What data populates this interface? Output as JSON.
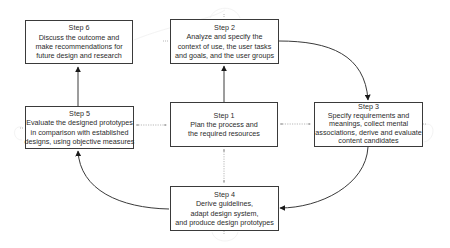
{
  "diagram": {
    "type": "process-cycle",
    "colors": {
      "box_border": "#3a3a3a",
      "text": "#2b2b2b",
      "arrow": "#3a3a3a",
      "dotted_connector": "#9a9a9a",
      "background": "#ffffff"
    },
    "steps": {
      "step1": {
        "title": "Step 1",
        "lines": [
          "Plan the process and",
          "the required resources"
        ]
      },
      "step2": {
        "title": "Step 2",
        "lines": [
          "Analyze and specify the",
          "context of use, the user tasks",
          "and goals, and the user groups"
        ]
      },
      "step3": {
        "title": "Step 3",
        "lines": [
          "Specify requirements and",
          "meanings, collect mental",
          "associations, derive and evaluate",
          "content candidates"
        ]
      },
      "step4": {
        "title": "Step 4",
        "lines": [
          "Derive guidelines,",
          "adapt design system,",
          "and produce design prototypes"
        ]
      },
      "step5": {
        "title": "Step 5",
        "lines": [
          "Evaluate the designed prototypes",
          "in comparison with established",
          "designs, using objective measures"
        ]
      },
      "step6": {
        "title": "Step 6",
        "lines": [
          "Discuss the outcome and",
          "make recommendations for",
          "future design and research"
        ]
      }
    },
    "flow": [
      {
        "from": "Step 1",
        "to": "Step 2",
        "style": "solid"
      },
      {
        "from": "Step 2",
        "to": "Step 3",
        "style": "solid-curved"
      },
      {
        "from": "Step 3",
        "to": "Step 4",
        "style": "solid-curved"
      },
      {
        "from": "Step 4",
        "to": "Step 5",
        "style": "solid-curved"
      },
      {
        "from": "Step 5",
        "to": "Step 6",
        "style": "solid"
      },
      {
        "from": "Step 1",
        "to": "Step 3",
        "style": "dotted-bidirectional"
      },
      {
        "from": "Step 1",
        "to": "Step 5",
        "style": "dotted-bidirectional"
      },
      {
        "from": "Step 1",
        "to": "Step 4",
        "style": "dotted-bidirectional"
      }
    ]
  }
}
